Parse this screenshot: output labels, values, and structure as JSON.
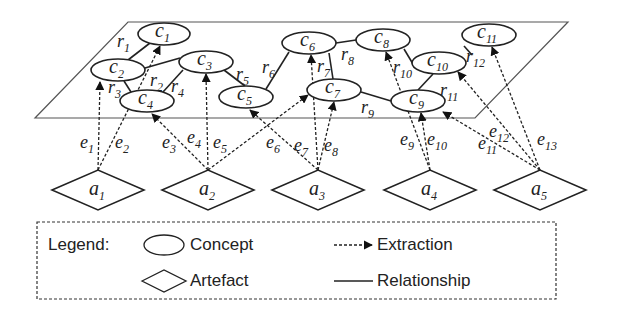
{
  "plane": {
    "points": [
      [
        128,
        22
      ],
      [
        568,
        22
      ],
      [
        475,
        118
      ],
      [
        35,
        118
      ]
    ],
    "stroke": "#555555"
  },
  "concepts": [
    {
      "id": "c1",
      "base": "c",
      "sub": "1",
      "cx": 164,
      "cy": 34,
      "rx": 26,
      "ry": 11
    },
    {
      "id": "c2",
      "base": "c",
      "sub": "2",
      "cx": 118,
      "cy": 70,
      "rx": 27,
      "ry": 11
    },
    {
      "id": "c3",
      "base": "c",
      "sub": "3",
      "cx": 206,
      "cy": 62,
      "rx": 27,
      "ry": 11
    },
    {
      "id": "c4",
      "base": "c",
      "sub": "4",
      "cx": 147,
      "cy": 101,
      "rx": 27,
      "ry": 11
    },
    {
      "id": "c5",
      "base": "c",
      "sub": "5",
      "cx": 246,
      "cy": 97,
      "rx": 27,
      "ry": 11
    },
    {
      "id": "c6",
      "base": "c",
      "sub": "6",
      "cx": 309,
      "cy": 43,
      "rx": 27,
      "ry": 11
    },
    {
      "id": "c7",
      "base": "c",
      "sub": "7",
      "cx": 334,
      "cy": 90,
      "rx": 27,
      "ry": 11
    },
    {
      "id": "c8",
      "base": "c",
      "sub": "8",
      "cx": 383,
      "cy": 40,
      "rx": 27,
      "ry": 11
    },
    {
      "id": "c9",
      "base": "c",
      "sub": "9",
      "cx": 418,
      "cy": 101,
      "rx": 27,
      "ry": 11
    },
    {
      "id": "c10",
      "base": "c",
      "sub": "10",
      "cx": 439,
      "cy": 63,
      "rx": 27,
      "ry": 11
    },
    {
      "id": "c11",
      "base": "c",
      "sub": "11",
      "cx": 489,
      "cy": 35,
      "rx": 27,
      "ry": 11
    }
  ],
  "relationships": [
    {
      "id": "r1",
      "from": [
        150,
        43
      ],
      "to": [
        128,
        60
      ],
      "label": "r",
      "sub": "1",
      "lx": 117,
      "ly": 47
    },
    {
      "id": "r2",
      "from": [
        145,
        68
      ],
      "to": [
        180,
        58
      ],
      "label": "r",
      "sub": "2",
      "lx": 150,
      "ly": 86
    },
    {
      "id": "r3",
      "from": [
        124,
        81
      ],
      "to": [
        131,
        92
      ],
      "label": "r",
      "sub": "3",
      "lx": 108,
      "ly": 93
    },
    {
      "id": "r4",
      "from": [
        163,
        92
      ],
      "to": [
        183,
        70
      ],
      "label": "r",
      "sub": "4",
      "lx": 171,
      "ly": 92
    },
    {
      "id": "r5",
      "from": [
        224,
        70
      ],
      "to": [
        245,
        86
      ],
      "label": "r",
      "sub": "5",
      "lx": 236,
      "ly": 80
    },
    {
      "id": "r6",
      "from": [
        266,
        89
      ],
      "to": [
        289,
        52
      ],
      "label": "r",
      "sub": "6",
      "lx": 262,
      "ly": 73
    },
    {
      "id": "r7",
      "from": [
        329,
        53
      ],
      "to": [
        333,
        79
      ],
      "label": "r",
      "sub": "7",
      "lx": 317,
      "ly": 72
    },
    {
      "id": "r8",
      "from": [
        336,
        43
      ],
      "to": [
        356,
        40
      ],
      "label": "r",
      "sub": "8",
      "lx": 341,
      "ly": 60
    },
    {
      "id": "r9",
      "from": [
        361,
        92
      ],
      "to": [
        391,
        101
      ],
      "label": "r",
      "sub": "9",
      "lx": 361,
      "ly": 113
    },
    {
      "id": "r10",
      "from": [
        404,
        49
      ],
      "to": [
        413,
        64
      ],
      "label": "r",
      "sub": "10",
      "lx": 393,
      "ly": 73
    },
    {
      "id": "r11",
      "from": [
        418,
        90
      ],
      "to": [
        433,
        74
      ],
      "label": "r",
      "sub": "11",
      "lx": 440,
      "ly": 96
    },
    {
      "id": "r12",
      "from": [
        464,
        46
      ],
      "to": [
        472,
        55
      ],
      "label": "r",
      "sub": "12",
      "lx": 466,
      "ly": 62
    }
  ],
  "artefacts": [
    {
      "id": "a1",
      "base": "a",
      "sub": "1",
      "cx": 98,
      "cy": 190,
      "w": 92,
      "h": 40
    },
    {
      "id": "a2",
      "base": "a",
      "sub": "2",
      "cx": 208,
      "cy": 190,
      "w": 92,
      "h": 40
    },
    {
      "id": "a3",
      "base": "a",
      "sub": "3",
      "cx": 318,
      "cy": 190,
      "w": 92,
      "h": 40
    },
    {
      "id": "a4",
      "base": "a",
      "sub": "4",
      "cx": 430,
      "cy": 190,
      "w": 92,
      "h": 40
    },
    {
      "id": "a5",
      "base": "a",
      "sub": "5",
      "cx": 540,
      "cy": 190,
      "w": 92,
      "h": 40
    }
  ],
  "extractions": [
    {
      "id": "e1",
      "from": [
        98,
        170
      ],
      "to": [
        100,
        82
      ],
      "label": "e",
      "sub": "1",
      "lx": 80,
      "ly": 148
    },
    {
      "id": "e2",
      "from": [
        98,
        170
      ],
      "to": [
        160,
        46
      ],
      "label": "e",
      "sub": "2",
      "lx": 115,
      "ly": 148
    },
    {
      "id": "e3",
      "from": [
        208,
        170
      ],
      "to": [
        152,
        114
      ],
      "label": "e",
      "sub": "3",
      "lx": 162,
      "ly": 148
    },
    {
      "id": "e4",
      "from": [
        208,
        170
      ],
      "to": [
        206,
        74
      ],
      "label": "e",
      "sub": "4",
      "lx": 187,
      "ly": 143
    },
    {
      "id": "e5",
      "from": [
        208,
        170
      ],
      "to": [
        308,
        95
      ],
      "label": "e",
      "sub": "5",
      "lx": 213,
      "ly": 148
    },
    {
      "id": "e6",
      "from": [
        318,
        170
      ],
      "to": [
        250,
        110
      ],
      "label": "e",
      "sub": "6",
      "lx": 266,
      "ly": 148
    },
    {
      "id": "e7",
      "from": [
        318,
        170
      ],
      "to": [
        311,
        55
      ],
      "label": "e",
      "sub": "7",
      "lx": 294,
      "ly": 151
    },
    {
      "id": "e8",
      "from": [
        318,
        170
      ],
      "to": [
        334,
        102
      ],
      "label": "e",
      "sub": "8",
      "lx": 324,
      "ly": 151
    },
    {
      "id": "e9",
      "from": [
        430,
        170
      ],
      "to": [
        386,
        52
      ],
      "label": "e",
      "sub": "9",
      "lx": 400,
      "ly": 145
    },
    {
      "id": "e10",
      "from": [
        430,
        170
      ],
      "to": [
        421,
        113
      ],
      "label": "e",
      "sub": "10",
      "lx": 427,
      "ly": 145
    },
    {
      "id": "e11",
      "from": [
        540,
        170
      ],
      "to": [
        443,
        112
      ],
      "label": "e",
      "sub": "11",
      "lx": 478,
      "ly": 149
    },
    {
      "id": "e12",
      "from": [
        540,
        170
      ],
      "to": [
        458,
        72
      ],
      "label": "e",
      "sub": "12",
      "lx": 489,
      "ly": 137
    },
    {
      "id": "e13",
      "from": [
        540,
        170
      ],
      "to": [
        492,
        47
      ],
      "label": "e",
      "sub": "13",
      "lx": 537,
      "ly": 145
    }
  ],
  "legend": {
    "box": {
      "x": 37,
      "y": 222,
      "w": 519,
      "h": 77
    },
    "title": "Legend:",
    "items": [
      {
        "kind": "concept",
        "label": "Concept"
      },
      {
        "kind": "artefact",
        "label": "Artefact"
      },
      {
        "kind": "extraction",
        "label": "Extraction"
      },
      {
        "kind": "relationship",
        "label": "Relationship"
      }
    ]
  },
  "colors": {
    "ink": "#222222",
    "plane": "#555555",
    "background": "#ffffff"
  }
}
